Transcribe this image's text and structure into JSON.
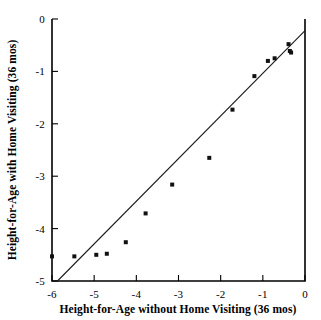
{
  "chart_data": {
    "type": "scatter",
    "title": "",
    "xlabel": "Height-for-Age without Home Visiting (36 mos)",
    "ylabel": "Height-for-Age with Home Visiting (36 mos)",
    "xlim": [
      -6,
      0
    ],
    "ylim": [
      -5,
      0
    ],
    "xticks": [
      -6,
      -5,
      -4,
      -3,
      -2,
      -1,
      0
    ],
    "yticks": [
      -5,
      -4,
      -3,
      -2,
      -1,
      0
    ],
    "xtick_labels": [
      "-6",
      "-5",
      "-4",
      "-3",
      "-2",
      "-1",
      "0"
    ],
    "ytick_labels": [
      "-5",
      "-4",
      "-3",
      "-2",
      "-1",
      "0"
    ],
    "grid": false,
    "legend": null,
    "series": [
      {
        "name": "sites",
        "marker": "filled-square",
        "points": [
          {
            "x": -6.0,
            "y": -4.53
          },
          {
            "x": -5.47,
            "y": -4.53
          },
          {
            "x": -4.95,
            "y": -4.5
          },
          {
            "x": -4.7,
            "y": -4.48
          },
          {
            "x": -4.25,
            "y": -4.26
          },
          {
            "x": -3.78,
            "y": -3.71
          },
          {
            "x": -3.15,
            "y": -3.16
          },
          {
            "x": -2.27,
            "y": -2.65
          },
          {
            "x": -1.72,
            "y": -1.73
          },
          {
            "x": -1.2,
            "y": -1.09
          },
          {
            "x": -0.88,
            "y": -0.8
          },
          {
            "x": -0.72,
            "y": -0.75
          },
          {
            "x": -0.39,
            "y": -0.48
          },
          {
            "x": -0.36,
            "y": -0.61
          },
          {
            "x": -0.33,
            "y": -0.64
          }
        ]
      }
    ],
    "reference_line": {
      "name": "identity-line",
      "description": "y = x diagonal reference line",
      "from": {
        "x": -5.87,
        "y": -5.0
      },
      "to": {
        "x": 0.0,
        "y": -0.22
      }
    }
  }
}
